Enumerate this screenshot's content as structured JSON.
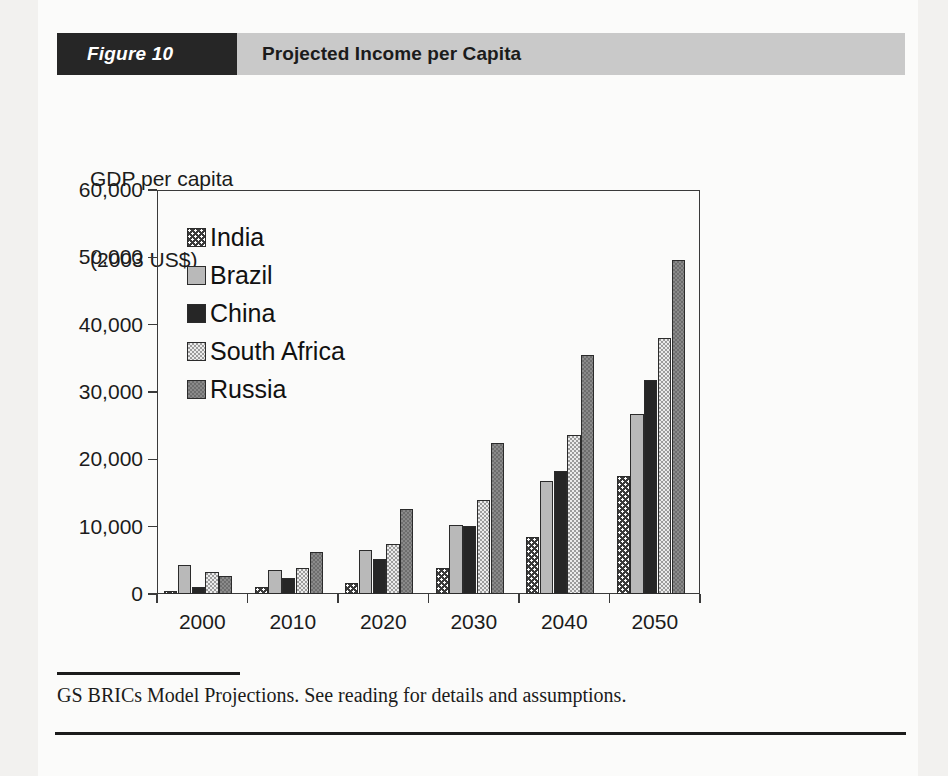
{
  "figure": {
    "number_label": "Figure 10",
    "title": "Projected Income per Capita",
    "source_note": "GS BRICs Model Projections. See reading for details and assumptions."
  },
  "colors": {
    "header_band": "#c9c9c9",
    "number_block": "#262626",
    "india": "#3a3a3a",
    "brazil": "#b9b9b9",
    "china": "#262626",
    "south_africa": "#ececec",
    "russia": "#8a8a8a",
    "axis": "#3a3a3a",
    "page": "#fbfbfa"
  },
  "chart_data": {
    "type": "bar",
    "title": "Projected Income per Capita",
    "xlabel": "",
    "ylabel": "GDP per capita\n(2003 US$)",
    "ylabel_line1": "GDP per capita",
    "ylabel_line2": "(2003 US$)",
    "categories": [
      "2000",
      "2010",
      "2020",
      "2030",
      "2040",
      "2050"
    ],
    "series": [
      {
        "name": "India",
        "values": [
          500,
          1000,
          1700,
          3800,
          8400,
          17500
        ]
      },
      {
        "name": "Brazil",
        "values": [
          4300,
          3600,
          6600,
          10200,
          16800,
          26800
        ]
      },
      {
        "name": "China",
        "values": [
          1000,
          2400,
          5200,
          10100,
          18300,
          31800
        ]
      },
      {
        "name": "South Africa",
        "values": [
          3200,
          3900,
          7500,
          13900,
          23600,
          38000
        ]
      },
      {
        "name": "Russia",
        "values": [
          2700,
          6200,
          12700,
          22500,
          35500,
          49600
        ]
      }
    ],
    "ylim": [
      0,
      60000
    ],
    "yticks": [
      0,
      10000,
      20000,
      30000,
      40000,
      50000,
      60000
    ],
    "ytick_labels": [
      "0",
      "10,000",
      "20,000",
      "30,000",
      "40,000",
      "50,000",
      "60,000"
    ],
    "grid": false,
    "legend_position": "inside-upper-left"
  }
}
